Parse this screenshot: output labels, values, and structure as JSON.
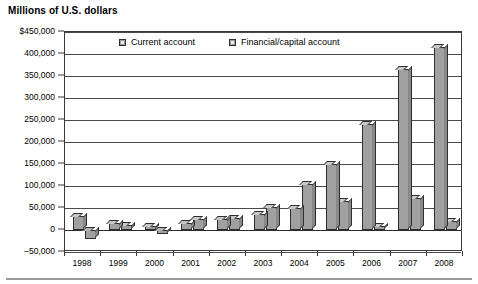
{
  "chart_data": {
    "type": "bar",
    "title": "Millions of U.S. dollars",
    "xlabel": "",
    "ylabel": "",
    "ylim": [
      -50000,
      450000
    ],
    "ytick_step": 50000,
    "grid": true,
    "legend_position": "top-inside",
    "categories": [
      "1998",
      "1999",
      "2000",
      "2001",
      "2002",
      "2003",
      "2004",
      "2005",
      "2006",
      "2007",
      "2008"
    ],
    "ytick_labels": [
      "$450,000",
      "400,000",
      "350,000",
      "300,000",
      "250,000",
      "200,000",
      "150,000",
      "100,000",
      "50,000",
      "0",
      "–50,000"
    ],
    "ytick_values": [
      450000,
      400000,
      350000,
      300000,
      250000,
      200000,
      150000,
      100000,
      50000,
      0,
      -50000
    ],
    "series": [
      {
        "name": "Current account",
        "values": [
          31000,
          15000,
          10000,
          17000,
          26000,
          36000,
          50000,
          150000,
          240000,
          365000,
          415000
        ]
      },
      {
        "name": "Financial/capital account",
        "values": [
          -20000,
          11000,
          -8000,
          24000,
          28000,
          53000,
          105000,
          65000,
          8000,
          72000,
          20000
        ]
      }
    ]
  },
  "legend": {
    "entries": [
      {
        "label": "Current account"
      },
      {
        "label": "Financial/capital account"
      }
    ]
  }
}
